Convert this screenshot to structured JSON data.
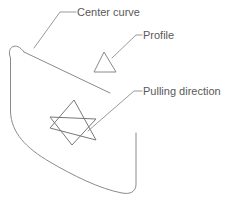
{
  "figure": {
    "background_color": "#ffffff",
    "width": 236,
    "height": 208,
    "line_color": "#8a8a8a",
    "star_color": "#777777",
    "text_color": "#595959"
  },
  "annotations": {
    "center_curve": {
      "label": "Center curve",
      "leader_from_x": 75,
      "leader_from_y": 12,
      "leader_to_x": 34,
      "leader_to_y": 48
    },
    "profile": {
      "label": "Profile",
      "leader_from_x": 141,
      "leader_from_y": 35,
      "leader_to_x": 112,
      "leader_to_y": 57
    },
    "pulling_direction": {
      "label": "Pulling direction",
      "leader_from_x": 141,
      "leader_from_y": 91,
      "leader_to_x": 88,
      "leader_to_y": 131
    }
  },
  "shapes": {
    "profile_triangle": {
      "name": "profile-triangle",
      "points": "104,52 116,72 94,72"
    },
    "pulling_star": {
      "name": "pulling-direction-hexagram",
      "triangle_up": "73,100 96,139 50,127",
      "triangle_down": "73,145 50,117 96,120"
    },
    "center_curve_line": {
      "name": "center-curve-line",
      "from_x": 24,
      "from_y": 52,
      "to_x": 110,
      "to_y": 93
    },
    "body_outline": {
      "name": "swept-body-outline",
      "path": "M 24,52 C 16,41 6,46 10,58 L 10,110 C 11,138 50,163 92,180 C 110,188 128,193 133,188 C 135,186 136,182 136,178 L 136,98"
    }
  }
}
